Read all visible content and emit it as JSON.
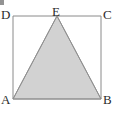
{
  "figure": {
    "kind": "geometry-diagram",
    "background_color": "#ffffff",
    "line_color": "#8a8a8a",
    "triangle_fill_color": "#d2d2d2",
    "triangle_stroke_color": "#9a9a9a",
    "label_color": "#2b2b2b",
    "labels": {
      "top_left": "D",
      "top_middle": "E",
      "top_right": "C",
      "bottom_left": "A",
      "bottom_right": "B"
    },
    "square": {
      "left": 13,
      "top": 16,
      "right": 101,
      "bottom": 99
    },
    "points": {
      "A": [
        13,
        99
      ],
      "B": [
        101,
        99
      ],
      "C": [
        101,
        16
      ],
      "D": [
        13,
        16
      ],
      "E": [
        57,
        16
      ]
    },
    "shaded_polygon": "A,E,B"
  }
}
